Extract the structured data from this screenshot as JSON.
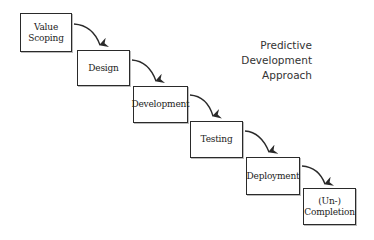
{
  "title": {
    "lines": [
      "Predictive",
      "Development",
      "Approach"
    ]
  },
  "phases": [
    {
      "label": "Value\nScoping",
      "x": 20,
      "y": 13,
      "w": 52,
      "h": 39
    },
    {
      "label": "Design",
      "x": 77,
      "y": 50,
      "w": 53,
      "h": 36
    },
    {
      "label": "Development",
      "x": 133,
      "y": 86,
      "w": 55,
      "h": 37
    },
    {
      "label": "Testing",
      "x": 190,
      "y": 121,
      "w": 53,
      "h": 37
    },
    {
      "label": "Deployment",
      "x": 246,
      "y": 157,
      "w": 54,
      "h": 38
    },
    {
      "label": "(Un-)\nCompletion",
      "x": 303,
      "y": 188,
      "w": 53,
      "h": 37
    }
  ],
  "colors": {
    "stroke": "#2a2a2a",
    "text": "#222222",
    "background": "#ffffff"
  }
}
